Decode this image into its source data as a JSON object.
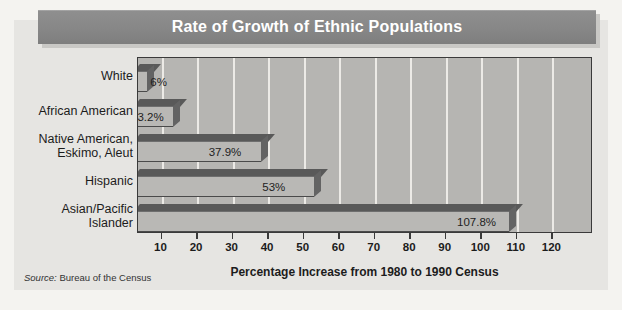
{
  "title": "Rate of Growth of Ethnic Populations",
  "source": "Source: Bureau of the Census",
  "source_prefix": "Source:",
  "source_rest": " Bureau of the Census",
  "axis_title": "Percentage Increase from 1980 to 1990 Census",
  "colors": {
    "page_background": "#f4f3f0",
    "card_background": "#e6e5e2",
    "title_banner": "#8d8d8d",
    "title_text": "#ffffff",
    "plot_background": "#b6b5b2",
    "gridline": "#eceae6",
    "bar_front": "#b9b8b5",
    "bar_top": "#595959",
    "bar_side": "#636363",
    "axis_line": "#3a3a3a",
    "text": "#1c1c1c"
  },
  "chart_data": {
    "type": "bar",
    "orientation": "horizontal",
    "title": "Rate of Growth of Ethnic Populations",
    "xlabel": "Percentage Increase from 1980 to 1990 Census",
    "ylabel": "",
    "xlim": [
      0,
      128
    ],
    "xticks": [
      10,
      20,
      30,
      40,
      50,
      60,
      70,
      80,
      90,
      100,
      110,
      120
    ],
    "xtick_labels": [
      "10",
      "20",
      "30",
      "40",
      "50",
      "60",
      "70",
      "80",
      "90",
      "100",
      "110",
      "120"
    ],
    "grid": true,
    "grid_axis": "x",
    "legend": false,
    "categories": [
      "White",
      "African American",
      "Native American,\nEskimo, Aleut",
      "Hispanic",
      "Asian/Pacific\nIslander"
    ],
    "values": [
      6,
      13.2,
      37.9,
      53,
      107.8
    ],
    "value_labels": [
      "6%",
      "13.2%",
      "37.9%",
      "53%",
      "107.8%"
    ],
    "source": "Source: Bureau of the Census"
  }
}
